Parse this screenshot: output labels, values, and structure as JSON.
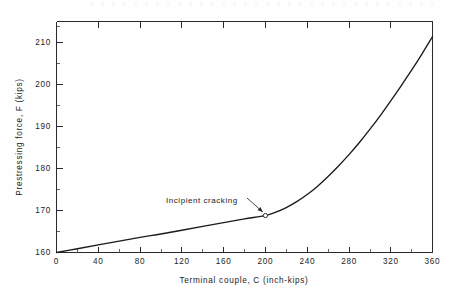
{
  "chart_data": {
    "type": "line",
    "title": "",
    "subtitle": "",
    "xlabel": "Terminal couple, C (inch-kips)",
    "ylabel": "Prestressing force, F (kips)",
    "xlim": [
      0,
      360
    ],
    "ylim": [
      160,
      215
    ],
    "xticks": [
      0,
      40,
      80,
      120,
      160,
      200,
      240,
      280,
      320,
      360
    ],
    "xtick_labels": [
      "0",
      "40",
      "80",
      "120",
      "160",
      "200",
      "240",
      "280",
      "320",
      "360"
    ],
    "xminor_step": 20,
    "yticks": [
      160,
      170,
      180,
      190,
      200,
      210
    ],
    "ytick_labels": [
      "160",
      "170",
      "180",
      "190",
      "200",
      "210"
    ],
    "yminor_step": 5,
    "grid": false,
    "legend": null,
    "series": [
      {
        "name": "Prestressing force vs terminal couple",
        "x": [
          0,
          20,
          40,
          60,
          80,
          100,
          120,
          140,
          160,
          180,
          200,
          210,
          220,
          230,
          240,
          250,
          260,
          270,
          280,
          290,
          300,
          310,
          320,
          330,
          340,
          350,
          360
        ],
        "values": [
          160.0,
          160.9,
          161.8,
          162.7,
          163.6,
          164.4,
          165.3,
          166.2,
          167.1,
          168.0,
          168.8,
          169.6,
          170.7,
          172.1,
          173.8,
          175.8,
          178.1,
          180.6,
          183.3,
          186.2,
          189.3,
          192.6,
          196.1,
          199.7,
          203.4,
          207.3,
          211.4
        ]
      }
    ],
    "annotations": [
      {
        "label": "Incipient  cracking",
        "point_x": 200,
        "point_y": 168.8,
        "marker": "open-circle",
        "leader": true
      }
    ]
  },
  "axes": {
    "x_axis_name": "terminal-couple-axis",
    "y_axis_name": "prestressing-force-axis"
  },
  "colors": {
    "curve": "#1b1b1b",
    "frame": "#2b2b2b",
    "text": "#1d1d1d",
    "background": "#fefefe",
    "marker_fill": "#ffffff"
  }
}
